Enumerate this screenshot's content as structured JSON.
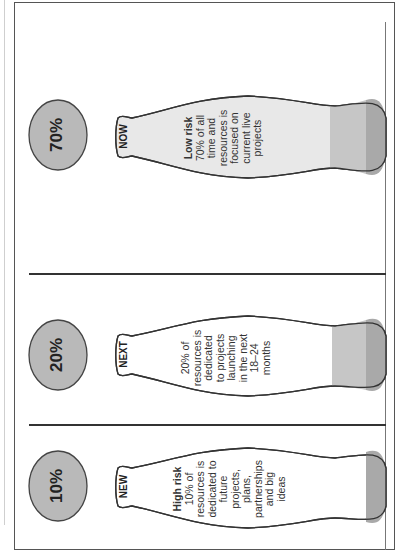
{
  "diagram": {
    "orientation": "rotated-90-ccw",
    "colors": {
      "circle_fill": "#b9b9b9",
      "bottle_outline": "#333333",
      "fill_light": "#e6e6e6",
      "fill_mid": "#c4c4c4",
      "fill_dark": "#a8a8a8",
      "border": "#555555"
    },
    "bottles": [
      {
        "percent": "70%",
        "neck_label": "NOW",
        "risk": "Low risk",
        "description_lines": [
          "70% of all",
          "time and",
          "resources is",
          "focused on",
          "current live",
          "projects"
        ]
      },
      {
        "percent": "20%",
        "neck_label": "NEXT",
        "risk": "",
        "description_lines": [
          "20% of",
          "resources is",
          "dedicated",
          "to projects",
          "launching",
          "in the next",
          "18–24",
          "months"
        ]
      },
      {
        "percent": "10%",
        "neck_label": "NEW",
        "risk": "High risk",
        "description_lines": [
          "10% of",
          "resources is",
          "dedicated to",
          "future",
          "projects,",
          "plans,",
          "partnerships",
          "and big",
          "ideas"
        ]
      }
    ]
  }
}
